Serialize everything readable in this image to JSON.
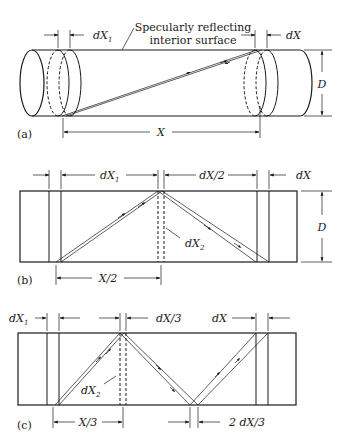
{
  "figure": {
    "panels": [
      {
        "id": "a",
        "label": "(a)",
        "annotation": [
          "Specularly reflecting",
          "interior surface"
        ],
        "dims": {
          "left_slice": "dX",
          "left_sub": "1",
          "right_slice": "dX",
          "length": "X",
          "diameter": "D"
        }
      },
      {
        "id": "b",
        "label": "(b)",
        "dims": {
          "left_slice": "dX",
          "left_sub": "1",
          "mid_gap": "dX/2",
          "right_slice": "dX",
          "inner": "dX",
          "inner_sub": "2",
          "half_length": "X/2",
          "diameter": "D"
        }
      },
      {
        "id": "c",
        "label": "(c)",
        "dims": {
          "left_slice": "dX",
          "left_sub": "1",
          "mid_gap": "dX/3",
          "right_slice": "dX",
          "inner": "dX",
          "inner_sub": "2",
          "third_length": "X/3",
          "bottom_gap": "2 dX/3"
        }
      }
    ]
  }
}
